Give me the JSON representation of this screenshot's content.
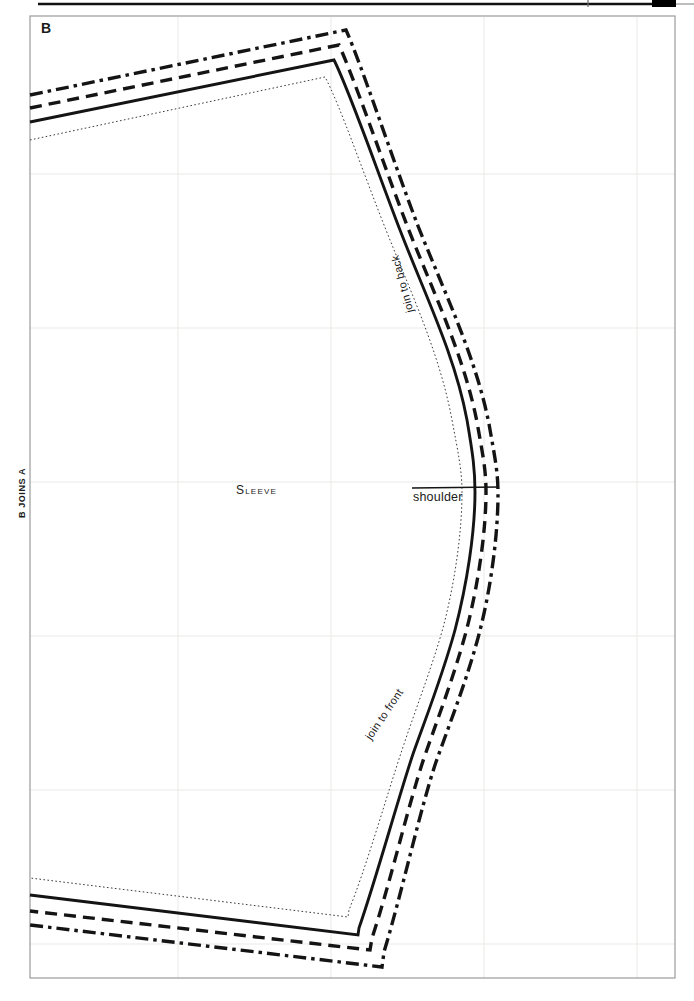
{
  "page": {
    "section_label": "B",
    "edge_label": "B JOINS A"
  },
  "pattern": {
    "piece_name": "Sleeve",
    "labels": {
      "shoulder": "shoulder",
      "join_to_back": "join to back",
      "join_to_front": "join to front"
    },
    "line_styles": [
      {
        "name": "seam-line",
        "style": "dotted"
      },
      {
        "name": "cutting-line-size-1",
        "style": "solid"
      },
      {
        "name": "cutting-line-size-2",
        "style": "dashed"
      },
      {
        "name": "cutting-line-size-3",
        "style": "dash-dot"
      }
    ]
  },
  "colors": {
    "ink": "#141414",
    "grid_line": "#e9e9e6",
    "grid_frame": "#9b9b9b",
    "page_background": "#ffffff",
    "header_tab": "#000000"
  }
}
